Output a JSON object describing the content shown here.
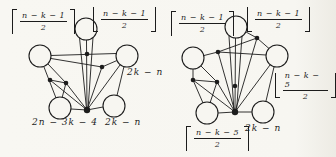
{
  "colors": {
    "paper": "#f7f6f1",
    "ink": "#1c1c1c"
  },
  "left": {
    "labels": {
      "top_left": {
        "bracket": "ceiling",
        "num": "n − k − 1",
        "den": "2"
      },
      "top_right": {
        "bracket": "floor",
        "num": "n − k − 1",
        "den": "2"
      },
      "right": "2k − n",
      "bottom_left": "2n − 3k − 4",
      "bottom_right": "2k − n"
    },
    "circle_r": 11,
    "circles": [
      [
        86,
        29
      ],
      [
        40,
        56
      ],
      [
        127,
        56
      ],
      [
        60,
        108
      ],
      [
        114,
        106
      ]
    ],
    "dots": [
      [
        87,
        54
      ],
      [
        102,
        67
      ],
      [
        50,
        80
      ],
      [
        66,
        83
      ]
    ],
    "hub": [
      87,
      110
    ],
    "edges": [
      [
        86.5,
        40,
        87,
        110
      ],
      [
        79.5,
        37.5,
        86.5,
        109
      ],
      [
        93,
        37.5,
        88,
        109.5
      ],
      [
        51,
        55.5,
        116,
        53.5
      ],
      [
        51,
        58.5,
        102,
        67
      ],
      [
        102,
        67,
        117,
        60.5
      ],
      [
        120,
        65,
        87,
        110
      ],
      [
        124,
        66.5,
        117,
        95.5
      ],
      [
        103,
        107,
        87,
        110
      ],
      [
        71,
        109,
        87,
        110
      ],
      [
        44,
        67,
        56,
        98
      ],
      [
        50,
        80,
        66,
        83
      ],
      [
        66,
        83,
        62,
        98
      ],
      [
        50,
        80,
        87,
        110
      ],
      [
        66,
        83,
        87,
        110
      ],
      [
        102,
        67,
        87,
        110
      ],
      [
        48,
        64,
        66,
        83
      ]
    ]
  },
  "right": {
    "labels": {
      "top_left": {
        "bracket": "ceiling",
        "num": "n − k − 1",
        "den": "2"
      },
      "top_right": {
        "bracket": "floor",
        "num": "n − k − 1",
        "den": "2"
      },
      "right": {
        "bracket": "floor",
        "num": "n − k − 5",
        "den": "2"
      },
      "bottom_left": {
        "bracket": "ceiling",
        "num": "n − k − 5",
        "den": "2"
      },
      "bottom_right": "2k − n"
    },
    "circle_r": 11,
    "circles": [
      [
        236,
        27
      ],
      [
        193,
        58
      ],
      [
        277,
        56
      ],
      [
        207,
        113
      ],
      [
        263,
        112
      ]
    ],
    "dots": [
      [
        218,
        52
      ],
      [
        257,
        38
      ],
      [
        193,
        80
      ],
      [
        217,
        82
      ],
      [
        235,
        86
      ]
    ],
    "hub": [
      235,
      112
    ],
    "edges": [
      [
        235.5,
        38,
        235,
        112
      ],
      [
        229,
        36.5,
        234,
        111
      ],
      [
        242,
        36.5,
        236.5,
        111
      ],
      [
        204,
        55.5,
        218,
        52
      ],
      [
        218,
        52,
        266,
        55
      ],
      [
        246,
        32,
        257,
        38
      ],
      [
        257,
        38,
        269,
        48.5
      ],
      [
        257,
        38,
        235,
        112
      ],
      [
        257,
        38,
        218,
        52
      ],
      [
        270,
        65,
        235,
        112
      ],
      [
        274,
        67,
        266,
        101
      ],
      [
        252,
        112,
        235,
        112
      ],
      [
        218,
        113,
        235,
        112
      ],
      [
        193,
        69,
        193,
        80
      ],
      [
        193,
        80,
        203,
        103
      ],
      [
        193,
        80,
        217,
        82
      ],
      [
        217,
        82,
        210,
        103
      ],
      [
        193,
        80,
        235,
        112
      ],
      [
        217,
        82,
        235,
        112
      ],
      [
        201,
        66,
        217,
        82
      ],
      [
        218,
        52,
        235,
        112
      ]
    ]
  }
}
